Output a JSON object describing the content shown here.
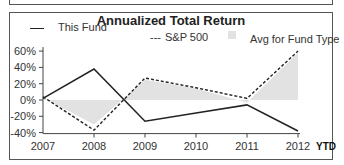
{
  "chart_data": {
    "type": "line",
    "title": "Annualized Total Return",
    "xlabel": "",
    "ylabel": "",
    "categories": [
      "2007",
      "2008",
      "2009",
      "2010",
      "2011",
      "2012"
    ],
    "x_suffix_label": "YTD",
    "yticks": [
      "60%",
      "40%",
      "20%",
      "0%",
      "-20%",
      "-40%"
    ],
    "ylim": [
      -40,
      60
    ],
    "grid": false,
    "legend_position": "top",
    "series": [
      {
        "name": "This Fund",
        "style": "solid",
        "values": [
          2,
          38,
          -26,
          -16,
          -6,
          -38
        ]
      },
      {
        "name": "S&P 500",
        "style": "dashed",
        "values": [
          4,
          -37,
          27,
          15,
          2,
          60
        ]
      },
      {
        "name": "Avg for Fund Type",
        "style": "area",
        "values": [
          3,
          -30,
          25,
          14,
          -3,
          58
        ]
      }
    ]
  },
  "legend": {
    "fund": "This Fund",
    "sp500_marker": "---",
    "sp500": "S&P 500",
    "avg": "Avg for Fund Type"
  },
  "colors": {
    "line": "#222222",
    "area": "#e2e2e2",
    "border": "#555555"
  }
}
